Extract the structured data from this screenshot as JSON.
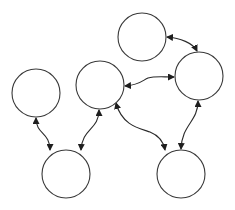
{
  "diagram": {
    "type": "graph",
    "directed": "bidirectional",
    "colors": {
      "stroke": "#3a3a3a",
      "background": "#ffffff"
    },
    "nodes": [
      {
        "id": "A",
        "label": "",
        "cx": 36,
        "cy": 93,
        "r": 24
      },
      {
        "id": "B",
        "label": "",
        "cx": 100,
        "cy": 85,
        "r": 24
      },
      {
        "id": "C",
        "label": "",
        "cx": 142,
        "cy": 37,
        "r": 24
      },
      {
        "id": "D",
        "label": "",
        "cx": 199,
        "cy": 76,
        "r": 24
      },
      {
        "id": "E",
        "label": "",
        "cx": 66,
        "cy": 174,
        "r": 24
      },
      {
        "id": "F",
        "label": "",
        "cx": 181,
        "cy": 174,
        "r": 24
      }
    ],
    "edges": [
      {
        "from": "A",
        "to": "E",
        "arrows": "both",
        "path": "M36,118 C36,135 50,132 50,150"
      },
      {
        "from": "B",
        "to": "E",
        "arrows": "both",
        "path": "M99,110 C99,130 82,128 81,150"
      },
      {
        "from": "B",
        "to": "D",
        "arrows": "both",
        "path": "M125,86 C140,85 143,80 148,78 C155,76 162,77 174,77"
      },
      {
        "from": "C",
        "to": "D",
        "arrows": "both",
        "path": "M167,37 C180,38 193,43 197,51"
      },
      {
        "from": "B",
        "to": "F",
        "arrows": "both",
        "path": "M116,103 C122,125 138,128 150,132 C160,136 164,144 165,150"
      },
      {
        "from": "D",
        "to": "F",
        "arrows": "both",
        "path": "M198,101 C198,122 182,124 181,149"
      }
    ]
  }
}
